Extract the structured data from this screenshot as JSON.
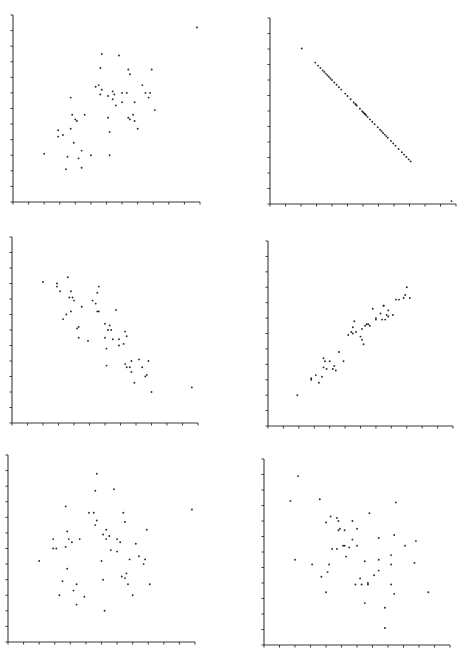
{
  "figure": {
    "width": 464,
    "height": 654,
    "background": "#ffffff",
    "axis_color": "#3a3a3a",
    "point_color": "#2a2a2a",
    "layout": "3 rows x 2 columns of unlabeled scatter plots"
  },
  "chart_data": [
    {
      "id": "panel-1",
      "type": "scatter",
      "title": "",
      "xlabel": "",
      "ylabel": "",
      "xlim": [
        0,
        12
      ],
      "ylim": [
        0,
        12
      ],
      "ticks": 13,
      "grid": false,
      "legend": null,
      "description": "moderate positive correlation with one far outlier",
      "frame": {
        "x0": 13,
        "y0": 202,
        "len": 187
      },
      "points": [
        [
          2.0,
          3.1
        ],
        [
          2.9,
          4.6
        ],
        [
          2.9,
          4.2
        ],
        [
          3.2,
          4.3
        ],
        [
          3.7,
          6.7
        ],
        [
          3.8,
          5.6
        ],
        [
          3.7,
          4.7
        ],
        [
          4.0,
          5.3
        ],
        [
          4.1,
          5.2
        ],
        [
          3.9,
          3.8
        ],
        [
          3.5,
          2.9
        ],
        [
          3.4,
          2.1
        ],
        [
          4.2,
          2.8
        ],
        [
          4.4,
          3.3
        ],
        [
          4.4,
          2.2
        ],
        [
          5.0,
          3.0
        ],
        [
          4.6,
          5.6
        ],
        [
          5.3,
          7.4
        ],
        [
          5.5,
          7.5
        ],
        [
          5.6,
          6.9
        ],
        [
          5.7,
          7.2
        ],
        [
          5.6,
          8.6
        ],
        [
          5.7,
          9.5
        ],
        [
          6.8,
          9.4
        ],
        [
          6.1,
          6.8
        ],
        [
          6.4,
          6.6
        ],
        [
          6.4,
          7.1
        ],
        [
          6.5,
          6.9
        ],
        [
          6.6,
          6.2
        ],
        [
          6.1,
          5.4
        ],
        [
          6.2,
          4.5
        ],
        [
          6.2,
          3.0
        ],
        [
          7.0,
          7.0
        ],
        [
          7.0,
          6.4
        ],
        [
          7.3,
          7.0
        ],
        [
          7.4,
          8.5
        ],
        [
          7.5,
          8.2
        ],
        [
          7.8,
          6.4
        ],
        [
          7.7,
          5.6
        ],
        [
          7.4,
          5.4
        ],
        [
          7.5,
          5.3
        ],
        [
          7.8,
          5.2
        ],
        [
          8.0,
          4.7
        ],
        [
          8.3,
          7.5
        ],
        [
          8.5,
          7.0
        ],
        [
          8.7,
          6.7
        ],
        [
          8.8,
          7.0
        ],
        [
          8.9,
          8.5
        ],
        [
          9.1,
          5.9
        ],
        [
          11.8,
          11.2
        ]
      ]
    },
    {
      "id": "panel-2",
      "type": "scatter",
      "title": "",
      "xlabel": "",
      "ylabel": "",
      "xlim": [
        0,
        12
      ],
      "ylim": [
        0,
        12
      ],
      "ticks": 13,
      "grid": false,
      "legend": null,
      "description": "perfect negative linear relationship with two outliers",
      "frame": {
        "x0": 270,
        "y0": 204,
        "len": 186
      },
      "points": [
        [
          2.05,
          10.03
        ],
        [
          2.92,
          9.12
        ],
        [
          3.1,
          8.93
        ],
        [
          3.25,
          8.78
        ],
        [
          3.4,
          8.62
        ],
        [
          3.5,
          8.52
        ],
        [
          3.6,
          8.41
        ],
        [
          3.7,
          8.31
        ],
        [
          3.8,
          8.21
        ],
        [
          3.9,
          8.1
        ],
        [
          4.0,
          8.0
        ],
        [
          4.15,
          7.84
        ],
        [
          4.3,
          7.69
        ],
        [
          4.45,
          7.53
        ],
        [
          4.6,
          7.38
        ],
        [
          4.85,
          7.12
        ],
        [
          5.0,
          6.97
        ],
        [
          5.2,
          6.76
        ],
        [
          5.4,
          6.55
        ],
        [
          5.5,
          6.45
        ],
        [
          5.55,
          6.4
        ],
        [
          5.6,
          6.35
        ],
        [
          5.8,
          6.14
        ],
        [
          5.95,
          5.98
        ],
        [
          6.0,
          5.93
        ],
        [
          6.05,
          5.88
        ],
        [
          6.1,
          5.83
        ],
        [
          6.15,
          5.78
        ],
        [
          6.2,
          5.72
        ],
        [
          6.3,
          5.62
        ],
        [
          6.45,
          5.46
        ],
        [
          6.6,
          5.31
        ],
        [
          6.75,
          5.15
        ],
        [
          6.95,
          4.95
        ],
        [
          7.1,
          4.79
        ],
        [
          7.2,
          4.69
        ],
        [
          7.3,
          4.58
        ],
        [
          7.4,
          4.48
        ],
        [
          7.5,
          4.38
        ],
        [
          7.6,
          4.27
        ],
        [
          7.8,
          4.07
        ],
        [
          7.95,
          3.91
        ],
        [
          8.1,
          3.76
        ],
        [
          8.3,
          3.55
        ],
        [
          8.5,
          3.34
        ],
        [
          8.65,
          3.19
        ],
        [
          8.8,
          3.03
        ],
        [
          8.95,
          2.88
        ],
        [
          9.07,
          2.75
        ],
        [
          11.7,
          0.19
        ]
      ]
    },
    {
      "id": "panel-3",
      "type": "scatter",
      "title": "",
      "xlabel": "",
      "ylabel": "",
      "xlim": [
        0,
        12
      ],
      "ylim": [
        0,
        12
      ],
      "ticks": 13,
      "grid": false,
      "legend": null,
      "description": "strong negative correlation with one outlier",
      "frame": {
        "x0": 12,
        "y0": 423,
        "len": 186
      },
      "points": [
        [
          2.0,
          9.1
        ],
        [
          2.9,
          9.0
        ],
        [
          2.9,
          8.8
        ],
        [
          3.1,
          8.5
        ],
        [
          3.6,
          9.4
        ],
        [
          3.8,
          8.5
        ],
        [
          3.7,
          8.1
        ],
        [
          3.9,
          8.1
        ],
        [
          4.0,
          7.9
        ],
        [
          4.5,
          7.5
        ],
        [
          3.8,
          7.2
        ],
        [
          3.5,
          7.0
        ],
        [
          3.3,
          6.7
        ],
        [
          4.2,
          6.1
        ],
        [
          4.3,
          6.2
        ],
        [
          4.3,
          5.5
        ],
        [
          4.9,
          5.3
        ],
        [
          5.2,
          7.9
        ],
        [
          5.4,
          7.7
        ],
        [
          5.5,
          8.4
        ],
        [
          5.6,
          8.8
        ],
        [
          5.5,
          7.2
        ],
        [
          5.6,
          7.2
        ],
        [
          6.7,
          7.3
        ],
        [
          6.0,
          6.4
        ],
        [
          6.3,
          6.3
        ],
        [
          6.2,
          6.0
        ],
        [
          6.4,
          6.0
        ],
        [
          6.0,
          5.5
        ],
        [
          6.1,
          4.8
        ],
        [
          6.1,
          3.7
        ],
        [
          6.5,
          5.4
        ],
        [
          6.9,
          5.4
        ],
        [
          6.9,
          5.0
        ],
        [
          7.2,
          5.1
        ],
        [
          7.3,
          5.9
        ],
        [
          7.4,
          5.6
        ],
        [
          7.3,
          3.8
        ],
        [
          7.4,
          3.6
        ],
        [
          7.6,
          3.6
        ],
        [
          7.7,
          4.0
        ],
        [
          7.7,
          3.3
        ],
        [
          7.9,
          2.6
        ],
        [
          8.2,
          4.1
        ],
        [
          8.4,
          3.6
        ],
        [
          8.6,
          3.0
        ],
        [
          8.7,
          3.1
        ],
        [
          8.8,
          4.0
        ],
        [
          9.0,
          2.0
        ],
        [
          11.6,
          2.3
        ]
      ]
    },
    {
      "id": "panel-4",
      "type": "scatter",
      "title": "",
      "xlabel": "",
      "ylabel": "",
      "xlim": [
        0,
        12
      ],
      "ylim": [
        0,
        12
      ],
      "ticks": 13,
      "grid": false,
      "legend": null,
      "description": "strong positive correlation",
      "frame": {
        "x0": 268,
        "y0": 426,
        "len": 185
      },
      "points": [
        [
          1.9,
          2.0
        ],
        [
          2.8,
          3.0
        ],
        [
          2.8,
          3.1
        ],
        [
          3.1,
          3.3
        ],
        [
          3.3,
          2.8
        ],
        [
          3.5,
          3.2
        ],
        [
          3.6,
          4.4
        ],
        [
          3.6,
          3.8
        ],
        [
          3.7,
          4.2
        ],
        [
          3.8,
          3.7
        ],
        [
          4.0,
          4.2
        ],
        [
          4.2,
          3.7
        ],
        [
          4.3,
          3.9
        ],
        [
          4.4,
          3.6
        ],
        [
          4.6,
          4.8
        ],
        [
          4.9,
          4.2
        ],
        [
          5.2,
          5.9
        ],
        [
          5.5,
          6.4
        ],
        [
          5.4,
          6.1
        ],
        [
          5.5,
          6.0
        ],
        [
          5.6,
          6.8
        ],
        [
          5.7,
          6.1
        ],
        [
          6.0,
          5.8
        ],
        [
          6.1,
          6.3
        ],
        [
          6.1,
          5.6
        ],
        [
          6.2,
          5.3
        ],
        [
          6.3,
          6.5
        ],
        [
          6.4,
          6.6
        ],
        [
          6.5,
          6.6
        ],
        [
          6.6,
          6.5
        ],
        [
          6.8,
          7.6
        ],
        [
          7.0,
          7.0
        ],
        [
          7.0,
          6.9
        ],
        [
          7.3,
          7.3
        ],
        [
          7.4,
          6.9
        ],
        [
          7.5,
          7.8
        ],
        [
          7.5,
          7.8
        ],
        [
          7.6,
          6.9
        ],
        [
          7.7,
          7.2
        ],
        [
          7.8,
          7.1
        ],
        [
          7.8,
          7.5
        ],
        [
          8.1,
          7.2
        ],
        [
          8.3,
          8.2
        ],
        [
          8.5,
          8.2
        ],
        [
          8.8,
          8.3
        ],
        [
          8.9,
          8.5
        ],
        [
          9.0,
          9.0
        ],
        [
          9.2,
          8.3
        ]
      ]
    },
    {
      "id": "panel-5",
      "type": "scatter",
      "title": "",
      "xlabel": "",
      "ylabel": "",
      "xlim": [
        0,
        12
      ],
      "ylim": [
        0,
        12
      ],
      "ticks": 13,
      "grid": false,
      "legend": null,
      "description": "no apparent correlation with one outlier",
      "frame": {
        "x0": 8,
        "y0": 642,
        "len": 187
      },
      "points": [
        [
          2.0,
          5.2
        ],
        [
          2.9,
          6.0
        ],
        [
          2.9,
          6.6
        ],
        [
          3.1,
          6.0
        ],
        [
          3.3,
          3.0
        ],
        [
          3.5,
          3.9
        ],
        [
          3.7,
          8.7
        ],
        [
          3.7,
          6.1
        ],
        [
          3.8,
          7.1
        ],
        [
          3.8,
          4.7
        ],
        [
          3.9,
          6.6
        ],
        [
          4.1,
          6.4
        ],
        [
          4.2,
          3.3
        ],
        [
          4.4,
          3.7
        ],
        [
          4.4,
          2.4
        ],
        [
          4.6,
          6.6
        ],
        [
          4.9,
          2.9
        ],
        [
          5.2,
          8.3
        ],
        [
          5.5,
          8.3
        ],
        [
          5.6,
          9.7
        ],
        [
          5.6,
          7.5
        ],
        [
          5.7,
          10.8
        ],
        [
          5.7,
          7.8
        ],
        [
          6.0,
          5.2
        ],
        [
          6.1,
          6.9
        ],
        [
          6.1,
          4.0
        ],
        [
          6.2,
          2.0
        ],
        [
          6.3,
          6.6
        ],
        [
          6.3,
          7.2
        ],
        [
          6.5,
          6.8
        ],
        [
          6.6,
          5.9
        ],
        [
          6.8,
          9.8
        ],
        [
          7.0,
          6.6
        ],
        [
          7.0,
          5.8
        ],
        [
          7.2,
          6.4
        ],
        [
          7.3,
          4.2
        ],
        [
          7.4,
          8.3
        ],
        [
          7.5,
          7.7
        ],
        [
          7.5,
          4.1
        ],
        [
          7.6,
          4.4
        ],
        [
          7.7,
          3.7
        ],
        [
          7.8,
          5.3
        ],
        [
          8.0,
          3.0
        ],
        [
          8.2,
          6.3
        ],
        [
          8.4,
          5.5
        ],
        [
          8.7,
          5.0
        ],
        [
          8.8,
          5.3
        ],
        [
          8.9,
          7.2
        ],
        [
          9.1,
          3.7
        ],
        [
          11.8,
          8.5
        ]
      ]
    },
    {
      "id": "panel-6",
      "type": "scatter",
      "title": "",
      "xlabel": "",
      "ylabel": "",
      "xlim": [
        0,
        12
      ],
      "ylim": [
        0,
        12
      ],
      "ticks": 13,
      "grid": false,
      "legend": null,
      "description": "no apparent correlation (slightly negative)",
      "frame": {
        "x0": 264,
        "y0": 645,
        "len": 186
      },
      "points": [
        [
          1.7,
          9.3
        ],
        [
          2.0,
          5.5
        ],
        [
          2.2,
          10.9
        ],
        [
          3.1,
          5.2
        ],
        [
          3.6,
          9.4
        ],
        [
          3.7,
          4.4
        ],
        [
          4.0,
          7.9
        ],
        [
          4.0,
          3.4
        ],
        [
          4.1,
          4.7
        ],
        [
          4.2,
          5.2
        ],
        [
          4.3,
          8.3
        ],
        [
          4.4,
          6.2
        ],
        [
          4.7,
          6.2
        ],
        [
          4.7,
          8.2
        ],
        [
          4.8,
          7.4
        ],
        [
          4.8,
          8.0
        ],
        [
          4.9,
          7.5
        ],
        [
          5.1,
          6.4
        ],
        [
          5.2,
          7.4
        ],
        [
          5.2,
          6.4
        ],
        [
          5.3,
          5.7
        ],
        [
          5.5,
          6.3
        ],
        [
          5.7,
          8.0
        ],
        [
          5.7,
          6.8
        ],
        [
          5.9,
          3.9
        ],
        [
          6.0,
          7.5
        ],
        [
          6.0,
          6.4
        ],
        [
          6.2,
          4.3
        ],
        [
          6.3,
          3.9
        ],
        [
          6.5,
          5.4
        ],
        [
          6.5,
          2.7
        ],
        [
          6.7,
          4.0
        ],
        [
          6.7,
          3.9
        ],
        [
          6.8,
          8.5
        ],
        [
          7.1,
          4.5
        ],
        [
          7.4,
          5.5
        ],
        [
          7.4,
          6.9
        ],
        [
          7.4,
          4.8
        ],
        [
          7.8,
          2.4
        ],
        [
          7.8,
          1.1
        ],
        [
          8.2,
          5.8
        ],
        [
          8.2,
          5.2
        ],
        [
          8.2,
          3.9
        ],
        [
          8.4,
          7.1
        ],
        [
          8.4,
          3.3
        ],
        [
          8.5,
          9.2
        ],
        [
          9.1,
          6.4
        ],
        [
          9.7,
          5.3
        ],
        [
          9.8,
          6.7
        ],
        [
          10.6,
          3.4
        ]
      ]
    }
  ]
}
